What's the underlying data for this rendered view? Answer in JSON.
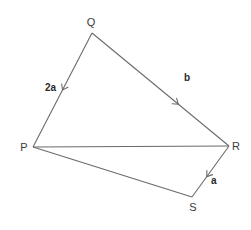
{
  "diagram": {
    "type": "vector-quadrilateral",
    "vertices": [
      {
        "id": "Q",
        "label": "Q",
        "x": 92,
        "y": 33,
        "lx": 91,
        "ly": 26
      },
      {
        "id": "P",
        "label": "P",
        "x": 33,
        "y": 147,
        "lx": 24,
        "ly": 151
      },
      {
        "id": "R",
        "label": "R",
        "x": 229,
        "y": 146,
        "lx": 236,
        "ly": 150
      },
      {
        "id": "S",
        "label": "S",
        "x": 192,
        "y": 197,
        "lx": 193,
        "ly": 211
      }
    ],
    "edges": [
      {
        "from": "Q",
        "to": "P",
        "vector_label": "2a",
        "directed": true,
        "arrow_t": 0.5
      },
      {
        "from": "Q",
        "to": "R",
        "vector_label": "b",
        "directed": true,
        "arrow_t": 0.63
      },
      {
        "from": "R",
        "to": "S",
        "vector_label": "a",
        "directed": true,
        "arrow_t": 0.6
      },
      {
        "from": "P",
        "to": "R",
        "vector_label": "",
        "directed": false
      },
      {
        "from": "P",
        "to": "S",
        "vector_label": "",
        "directed": false
      }
    ],
    "edge_labels": [
      {
        "text": "2a",
        "x": 45,
        "y": 91
      },
      {
        "text": "b",
        "x": 184,
        "y": 81
      },
      {
        "text": "a",
        "x": 211,
        "y": 184
      }
    ],
    "colors": {
      "line": "#6b6b6b",
      "text": "#3a3a3a",
      "background": "#ffffff"
    }
  }
}
